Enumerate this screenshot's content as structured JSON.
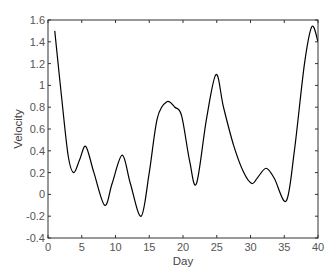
{
  "chart_data": {
    "type": "line",
    "title": "",
    "xlabel": "Day",
    "ylabel": "Velocity",
    "xlim": [
      0,
      40
    ],
    "ylim": [
      -0.4,
      1.6
    ],
    "xticks": [
      0,
      5,
      10,
      15,
      20,
      25,
      30,
      35,
      40
    ],
    "xtick_labels": [
      "0",
      "5",
      "10",
      "15",
      "20",
      "25",
      "30",
      "35",
      "40"
    ],
    "yticks": [
      -0.4,
      -0.2,
      0,
      0.2,
      0.4,
      0.6,
      0.8,
      1,
      1.2,
      1.4,
      1.6
    ],
    "ytick_labels": [
      "-0.4",
      "-0.2",
      "0",
      "0.2",
      "0.4",
      "0.6",
      "0.8",
      "1",
      "1.2",
      "1.4",
      "1.6"
    ],
    "grid": false,
    "legend": null,
    "series": [
      {
        "name": "Velocity",
        "color": "#000000",
        "x": [
          1,
          2,
          3,
          3.8,
          4.7,
          5.6,
          6.8,
          8.4,
          9.5,
          11,
          12.2,
          13.8,
          15,
          16.2,
          17.6,
          18.8,
          19.8,
          21,
          22,
          23.5,
          24.9,
          26,
          27.5,
          29,
          30.2,
          31,
          32.3,
          33.5,
          35.3,
          36.5,
          38,
          39.1,
          40
        ],
        "values": [
          1.5,
          0.9,
          0.35,
          0.2,
          0.32,
          0.44,
          0.2,
          -0.1,
          0.1,
          0.36,
          0.1,
          -0.2,
          0.2,
          0.7,
          0.85,
          0.8,
          0.72,
          0.3,
          0.1,
          0.7,
          1.1,
          0.8,
          0.45,
          0.2,
          0.1,
          0.15,
          0.24,
          0.15,
          -0.06,
          0.4,
          1.2,
          1.54,
          1.4
        ]
      }
    ]
  },
  "colors": {
    "axis": "#333333",
    "line": "#000000",
    "tick_text": "#555555"
  }
}
